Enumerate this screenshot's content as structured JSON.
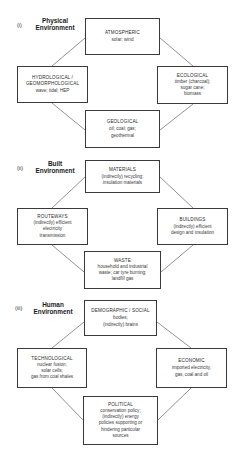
{
  "sections": [
    {
      "number": "(i)",
      "title_line1": "Physical",
      "title_line2": "Environment",
      "boxes": {
        "top": {
          "title": "ATMOSPHERIC",
          "body": "solar; wind"
        },
        "left": {
          "title": "HYDROLOGICAL /\nGEOMORPHOLOGICAL",
          "title_line1": "HYDROLOGICAL /",
          "title_line2": "GEOMORPHOLOGICAL",
          "body": "wave; tidal; HEP"
        },
        "right": {
          "title": "ECOLOGICAL",
          "body_line1": "timber (charcoal);",
          "body_line2": "sugar cane;",
          "body_line3": "biomass"
        },
        "bottom": {
          "title": "GEOLOGICAL",
          "body_line1": "oil; coal; gas;",
          "body_line2": "geothermal"
        }
      }
    },
    {
      "number": "(ii)",
      "title_line1": "Built",
      "title_line2": "Environment",
      "boxes": {
        "top": {
          "title": "MATERIALS",
          "body_line1": "(indirectly) recycling;",
          "body_line2": "insulation materials"
        },
        "left": {
          "title": "ROUTEWAYS",
          "body_line1": "(indirectly) efficient",
          "body_line2": "electricity",
          "body_line3": "transmission"
        },
        "right": {
          "title": "BUILDINGS",
          "body_line1": "(indirectly) efficient",
          "body_line2": "design and insulation"
        },
        "bottom": {
          "title": "WASTE",
          "body_line1": "household and industrial",
          "body_line2": "waste; car tyre burning;",
          "body_line3": "landfill gas"
        }
      }
    },
    {
      "number": "(iii)",
      "title_line1": "Human",
      "title_line2": "Environment",
      "boxes": {
        "top": {
          "title": "DEMOGRAPHIC / SOCIAL",
          "body_line1": "bodies;",
          "body_line2": "(indirectly) brains"
        },
        "left": {
          "title": "TECHNOLOGICAL",
          "body_line1": "nuclear fusion;",
          "body_line2": "solar cells;",
          "body_line3": "gas from coal shales"
        },
        "right": {
          "title": "ECONOMIC",
          "body_line1": "imported electricity,",
          "body_line2": "gas, coal and oil"
        },
        "bottom": {
          "title": "POLITICAL",
          "body_line1": "conservation policy;",
          "body_line2": "(indirectly) energy",
          "body_line3": "policies supporting or",
          "body_line4": "hindering particular",
          "body_line5": "sources"
        }
      }
    }
  ],
  "colors": {
    "line": "#4a4a4a",
    "border": "#3a3a3a",
    "text": "#2a2a2a",
    "background": "#ffffff"
  }
}
